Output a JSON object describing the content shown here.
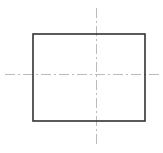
{
  "drawing": {
    "type": "orthographic-view",
    "rectangle": {
      "x": 33,
      "y": 34,
      "width": 112,
      "height": 87,
      "stroke": "#333333",
      "stroke_width": 1.6
    },
    "centerlines": {
      "color": "#aaaaaa",
      "dash": "10 3 2 3",
      "vertical": {
        "x": 96,
        "y1": 8,
        "y2": 144
      },
      "horizontal": {
        "y": 74,
        "x1": 5,
        "x2": 162
      }
    }
  }
}
